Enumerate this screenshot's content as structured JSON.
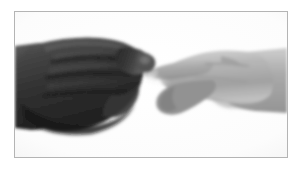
{
  "page": {
    "width": 302,
    "height": 171,
    "background_color": "#ffffff"
  },
  "frame": {
    "name": "photo-frame",
    "border_color": "#b4b4b4",
    "border_width": 1,
    "x": 14,
    "y": 11,
    "width": 274,
    "height": 147,
    "inner_background_color": "#ffffff"
  },
  "photograph": {
    "type": "grayscale-photograph",
    "caption": "A dark-skinned closed fist on the left extends an index finger that touches the fingertip of a light-skinned hand entering from the right.",
    "background_color": "#fbfbfb",
    "subjects": [
      {
        "name": "left-hand",
        "description": "Dark closed fist in profile, knuckles upward, entering from the left edge of the frame, index finger extended to the right toward the contact point",
        "tone": "dark",
        "fill_color": "#2e2e2e",
        "shadow_color": "#161616",
        "highlight_color": "#6f6f6f"
      },
      {
        "name": "right-hand",
        "description": "Light-skinned hand entering from the right edge of the frame, index finger extended to the left, middle finger curled below",
        "tone": "light",
        "fill_color": "#b0b0b0",
        "shadow_color": "#8a8a8a",
        "highlight_color": "#d8d8d8"
      }
    ],
    "contact_point": {
      "name": "fingertip-contact",
      "x": 146,
      "y": 55,
      "description": "The two index fingertips meet near the upper centre of the photograph"
    }
  }
}
